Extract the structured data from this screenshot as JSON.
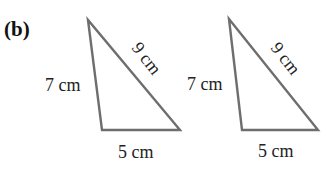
{
  "part_label": "(b)",
  "triangles": [
    {
      "name": "triangle-1",
      "sides": {
        "left": "7 cm",
        "hypotenuse": "9 cm",
        "base": "5 cm"
      },
      "vertices": {
        "top": [
          88,
          20
        ],
        "bottom_left": [
          102,
          130
        ],
        "bottom_right": [
          180,
          130
        ]
      }
    },
    {
      "name": "triangle-2",
      "sides": {
        "left": "7 cm",
        "hypotenuse": "9 cm",
        "base": "5 cm"
      },
      "vertices": {
        "top": [
          229,
          19
        ],
        "bottom_left": [
          242,
          130
        ],
        "bottom_right": [
          318,
          130
        ]
      }
    }
  ],
  "colors": {
    "stroke": "#6e6e6e",
    "text": "#222222"
  }
}
